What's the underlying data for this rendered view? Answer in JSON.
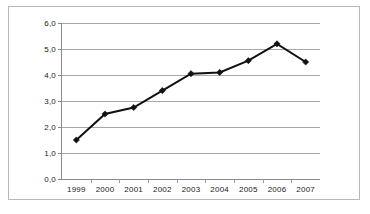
{
  "chart_data": {
    "type": "line",
    "title": "",
    "subtitle": "",
    "xlabel": "",
    "ylabel": "",
    "categories": [
      "1999",
      "2000",
      "2001",
      "2002",
      "2003",
      "2004",
      "2005",
      "2006",
      "2007"
    ],
    "values": [
      1.5,
      2.5,
      2.75,
      3.4,
      4.05,
      4.1,
      4.55,
      5.2,
      4.5
    ],
    "series": [
      {
        "name": "",
        "values": [
          1.5,
          2.5,
          2.75,
          3.4,
          4.05,
          4.1,
          4.55,
          5.2,
          4.5
        ]
      }
    ],
    "ylim": [
      0,
      6
    ],
    "ytick_values": [
      0,
      1,
      2,
      3,
      4,
      5,
      6
    ],
    "ytick_labels": [
      "0,0",
      "1,0",
      "2,0",
      "3,0",
      "4,0",
      "5,0",
      "6,0"
    ],
    "decimal_separator": ",",
    "grid": true,
    "grid_axis": "y",
    "legend": false,
    "legend_position": "none",
    "marker": "diamond",
    "annotations": [],
    "colors": {
      "line": "#111111",
      "marker": "#111111",
      "gridline": "#a8a8a8",
      "axis": "#8a8a8a",
      "frame": "#b9b9b9",
      "background": "#ffffff",
      "text": "#1a1a1a"
    }
  }
}
